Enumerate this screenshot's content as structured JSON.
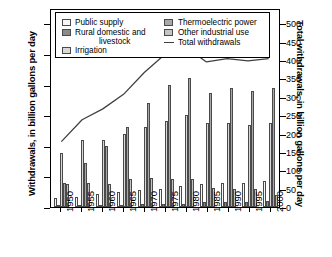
{
  "axes": {
    "left_title": "Withdrawals, in billion gallons per day",
    "right_title": "Total withdrawals, in billion gallons per day"
  },
  "legend": {
    "items": [
      {
        "label": "Public supply",
        "icon": "legend-swatch-public-supply",
        "color": "#f7f7f7"
      },
      {
        "label": "Rural domestic and",
        "label2": "livestock",
        "icon": "legend-swatch-rural-domestic",
        "color": "#8a8a8a"
      },
      {
        "label": "Irrigation",
        "icon": "legend-swatch-irrigation",
        "color": "#d8d8d8"
      },
      {
        "label": "Thermoelectric power",
        "icon": "legend-swatch-thermoelectric",
        "color": "#a8a8a8"
      },
      {
        "label": "Other industrial use",
        "icon": "legend-swatch-other-industrial",
        "color": "#c4c4c4"
      },
      {
        "label": "Total withdrawals",
        "icon": "legend-line-total-withdrawals",
        "color": "#404040"
      }
    ]
  },
  "chart_data": {
    "type": "bar",
    "title": "",
    "xlabel": "",
    "ylabel": "Withdrawals, in billion gallons per day",
    "y2label": "Total withdrawals, in billion gallons per day",
    "categories": [
      "1950",
      "1955",
      "1960",
      "1965",
      "1970",
      "1975",
      "1980",
      "1985",
      "1990",
      "1995",
      "2000"
    ],
    "ylim": [
      0,
      325
    ],
    "yticks": [
      0,
      50,
      100,
      150,
      200,
      250,
      300
    ],
    "y2lim": [
      0,
      542
    ],
    "y2ticks": [
      0,
      50,
      100,
      150,
      200,
      250,
      300,
      350,
      400,
      450,
      500
    ],
    "grid": false,
    "legend_position": "top-inside",
    "series": [
      {
        "name": "Public supply",
        "color": "#f7f7f7",
        "values": [
          14,
          17,
          21,
          24,
          27,
          29,
          34,
          37,
          39,
          40,
          43
        ]
      },
      {
        "name": "Rural domestic and livestock",
        "color": "#8a8a8a",
        "values": [
          3.6,
          3.6,
          3.6,
          4.0,
          4.5,
          4.9,
          5.6,
          7.8,
          8.0,
          8.9,
          9.5
        ]
      },
      {
        "name": "Irrigation",
        "color": "#d8d8d8",
        "values": [
          89,
          110,
          110,
          120,
          130,
          140,
          150,
          137,
          137,
          134,
          137
        ]
      },
      {
        "name": "Thermoelectric power",
        "color": "#a8a8a8",
        "values": [
          40,
          72,
          100,
          130,
          170,
          200,
          210,
          187,
          195,
          190,
          195
        ]
      },
      {
        "name": "Other industrial use",
        "color": "#c4c4c4",
        "values": [
          37,
          39,
          38,
          46,
          47,
          45,
          45,
          30.5,
          29.9,
          29.1,
          19.7
        ]
      }
    ],
    "line_series": {
      "name": "Total withdrawals",
      "color": "#404040",
      "axis": "right",
      "values": [
        180,
        240,
        270,
        310,
        370,
        420,
        440,
        399,
        408,
        402,
        408
      ]
    }
  }
}
